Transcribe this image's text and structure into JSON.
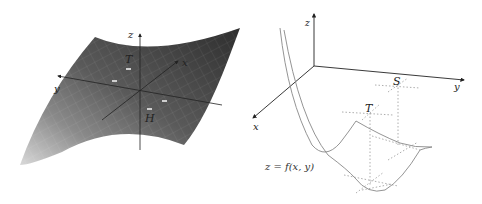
{
  "figure": {
    "left_panel": {
      "description": "Shaded 3D saddle surface with coordinate axes",
      "axes": {
        "x_label": "x",
        "y_label": "y",
        "z_label": "z"
      },
      "points": [
        {
          "label": "T"
        },
        {
          "label": "H"
        }
      ],
      "colors": {
        "surface_dark": "#3a3a3a",
        "surface_mid": "#5c5c5c",
        "surface_light": "#c8c8c8",
        "axis": "#222222"
      }
    },
    "right_panel": {
      "description": "Cross-section curves of a surface with stationary points",
      "axes": {
        "x_label": "x",
        "y_label": "y",
        "z_label": "z"
      },
      "points": [
        {
          "label": "S"
        },
        {
          "label": "T"
        }
      ],
      "equation": "z = f(x, y)",
      "colors": {
        "curve": "#888888",
        "axis": "#222222",
        "guide": "#999999"
      }
    }
  }
}
